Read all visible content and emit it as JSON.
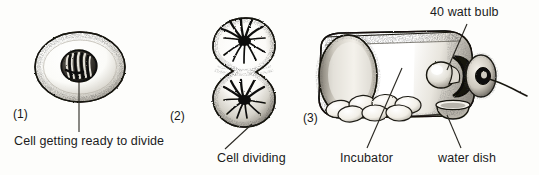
{
  "figure": {
    "background_color": "#fdfdfb",
    "ink_color": "#1b1b1b"
  },
  "panels": [
    {
      "number": "(1)",
      "subject": "cell-getting-ready-to-divide",
      "caption": "Cell getting ready to divide",
      "parts": [
        "cell-membrane",
        "cytoplasm",
        "nucleus",
        "chromosomes"
      ]
    },
    {
      "number": "(2)",
      "subject": "cell-dividing",
      "caption": "Cell dividing",
      "parts": [
        "upper-daughter-cell",
        "lower-daughter-cell",
        "chromosome-spindle-upper",
        "chromosome-spindle-lower"
      ]
    },
    {
      "number": "(3)",
      "subject": "incubator",
      "captions": {
        "bulb": "40 watt bulb",
        "incubator": "Incubator",
        "water_dish": "water dish"
      },
      "parts": [
        "cylinder-body",
        "end-cap",
        "eggs",
        "water-dish",
        "light-bulb",
        "bulb-socket",
        "reflector-plate",
        "power-cord"
      ],
      "egg_count": 7
    }
  ]
}
